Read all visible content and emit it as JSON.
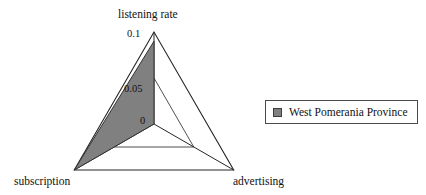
{
  "chart_data": {
    "type": "radar",
    "title": "",
    "categories": [
      "listening rate",
      "subscription",
      "advertising"
    ],
    "series": [
      {
        "name": "West Pomerania Province",
        "values": [
          0.09,
          0.1,
          0.0
        ],
        "fill_color": "#808080",
        "stroke_color": "#333333"
      }
    ],
    "tick_values": [
      0,
      0.05,
      0.1
    ],
    "tick_labels": [
      "0",
      "0.05",
      "0.1"
    ],
    "rlim": [
      0,
      0.1
    ],
    "grid": true,
    "grid_rings": 2,
    "legend_position": "right",
    "xlabel": "",
    "ylabel": ""
  },
  "axes": {
    "top": "listening rate",
    "bottom_left": "subscription",
    "bottom_right": "advertising"
  },
  "ticks": {
    "outer": "0.1",
    "middle": "0.05",
    "center": "0"
  },
  "legend": {
    "entries": [
      {
        "label": "West Pomerania Province",
        "color": "#808080"
      }
    ]
  },
  "colors": {
    "series_fill": "#808080",
    "axis_stroke": "#262626",
    "grid_stroke": "#3d3d3d",
    "background": "#ffffff",
    "text": "#111111"
  }
}
